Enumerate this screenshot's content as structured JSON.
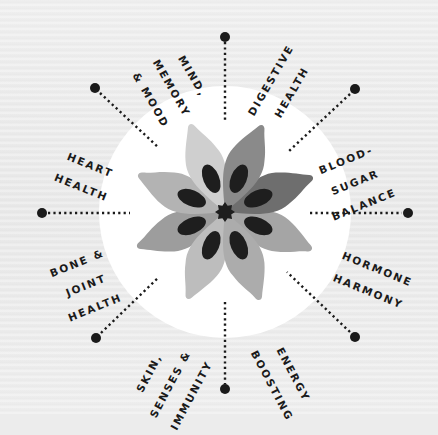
{
  "diagram": {
    "center": [
      225,
      212
    ],
    "colors": {
      "background": "#ececec",
      "disc": "#ffffff",
      "ink": "#1a1a1a",
      "petal_light": "#c9c9c9",
      "petal_mid": "#9d9d9d",
      "petal_dark": "#6e6e6e",
      "seed": "#1e1e1e"
    },
    "center_icon": "star-burst-icon",
    "spoke_end_icon": "dot-icon",
    "labels": [
      {
        "id": "mind-memory-mood",
        "lines": [
          "MIND,",
          "MEMORY",
          "& MOOD"
        ]
      },
      {
        "id": "digestive-health",
        "lines": [
          "DIGESTIVE",
          "HEALTH"
        ]
      },
      {
        "id": "blood-sugar-balance",
        "lines": [
          "BLOOD-",
          "SUGAR",
          "BALANCE"
        ]
      },
      {
        "id": "hormone-harmony",
        "lines": [
          "HORMONE",
          "HARMONY"
        ]
      },
      {
        "id": "energy-boosting",
        "lines": [
          "ENERGY",
          "BOOSTING"
        ]
      },
      {
        "id": "skin-senses-immunity",
        "lines": [
          "SKIN,",
          "SENSES &",
          "IMMUNITY"
        ]
      },
      {
        "id": "bone-joint-health",
        "lines": [
          "BONE &",
          "JOINT",
          "HEALTH"
        ]
      },
      {
        "id": "heart-health",
        "lines": [
          "HEART",
          "HEALTH"
        ]
      }
    ]
  }
}
